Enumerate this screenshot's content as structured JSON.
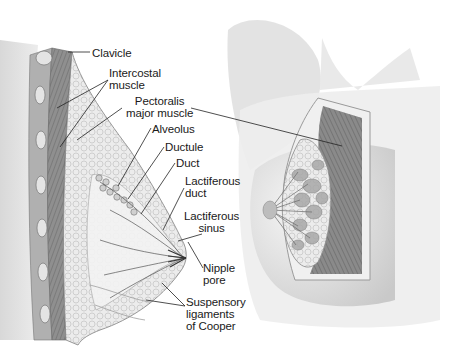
{
  "diagram": {
    "colors": {
      "background": "#ffffff",
      "label_text": "#1a1a1a",
      "leader_line": "#222222",
      "muscle": "#8a8a8a",
      "tissue_light": "#e6e6e6",
      "skin_shade": "#d4d4d4"
    },
    "labels": [
      {
        "id": "clavicle",
        "text": "Clavicle",
        "x": 92,
        "y": 48,
        "align": "left"
      },
      {
        "id": "intercostal-muscle",
        "text": "Intercostal\nmuscle",
        "x": 109,
        "y": 67,
        "align": "left"
      },
      {
        "id": "pectoralis-major-muscle",
        "text": "Pectoralis\nmajor muscle",
        "x": 126,
        "y": 95,
        "align": "center"
      },
      {
        "id": "alveolus",
        "text": "Alveolus",
        "x": 152,
        "y": 123,
        "align": "left"
      },
      {
        "id": "ductule",
        "text": "Ductule",
        "x": 165,
        "y": 141,
        "align": "left"
      },
      {
        "id": "duct",
        "text": "Duct",
        "x": 176,
        "y": 158,
        "align": "left"
      },
      {
        "id": "lactiferous-duct",
        "text": "Lactiferous\nduct",
        "x": 185,
        "y": 175,
        "align": "left"
      },
      {
        "id": "lactiferous-sinus",
        "text": "Lactiferous\nsinus",
        "x": 184,
        "y": 210,
        "align": "center"
      },
      {
        "id": "nipple-pore",
        "text": "Nipple\npore",
        "x": 203,
        "y": 262,
        "align": "left"
      },
      {
        "id": "suspensory-ligaments",
        "text": "Suspensory\nligaments\nof Cooper",
        "x": 186,
        "y": 296,
        "align": "left"
      }
    ]
  }
}
